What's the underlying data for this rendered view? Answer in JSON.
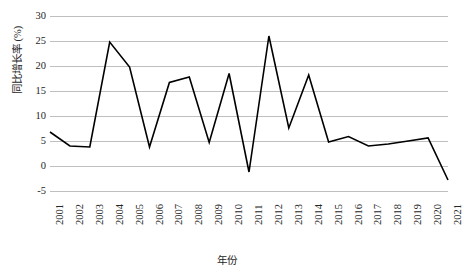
{
  "chart_data": {
    "type": "line",
    "title": "",
    "xlabel": "年份",
    "ylabel": "同比增长率 (%)",
    "ylim": [
      -5,
      30
    ],
    "yticks": [
      30,
      25,
      20,
      15,
      10,
      5,
      0,
      -5
    ],
    "grid": true,
    "legend": "none",
    "line_color": "#000000",
    "grid_color": "#bfbfbf",
    "background": "#ffffff",
    "categories": [
      "2001",
      "2002",
      "2003",
      "2004",
      "2005",
      "2006",
      "2007",
      "2008",
      "2009",
      "2010",
      "2011",
      "2012",
      "2013",
      "2014",
      "2015",
      "2016",
      "2017",
      "2018",
      "2019",
      "2020",
      "2021"
    ],
    "values": [
      6.8,
      4.0,
      3.8,
      24.8,
      19.8,
      3.8,
      16.7,
      17.8,
      4.7,
      18.5,
      -1.2,
      26.0,
      7.6,
      18.2,
      4.8,
      5.9,
      4.0,
      4.4,
      5.0,
      5.6,
      -2.8
    ]
  }
}
